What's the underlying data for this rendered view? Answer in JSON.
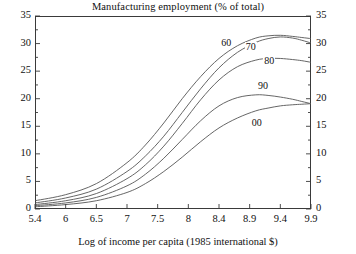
{
  "chart_data": {
    "type": "line",
    "title": "Manufacturing employment (% of total)",
    "xlabel": "Log of income per capita (1985 international $)",
    "ylabel": "",
    "xlim": [
      5.4,
      9.9
    ],
    "ylim": [
      0,
      35
    ],
    "grid": false,
    "legend_position": "inline-labels",
    "x_ticks": [
      "5.4",
      "6",
      "6.5",
      "7",
      "7.5",
      "8",
      "8.4",
      "8.9",
      "9.4",
      "9.9"
    ],
    "y_ticks_left": [
      "0",
      "5",
      "10",
      "15",
      "20",
      "25",
      "30",
      "35"
    ],
    "y_ticks_right": [
      "0",
      "5",
      "10",
      "15",
      "20",
      "25",
      "30",
      "35"
    ],
    "y_minor_tick_step": 2.5,
    "series": [
      {
        "name": "60",
        "label": "60",
        "x": [
          5.4,
          5.9,
          6.4,
          6.9,
          7.2,
          7.5,
          7.8,
          8.1,
          8.4,
          8.7,
          9.0,
          9.2,
          9.4,
          9.6,
          9.75,
          9.9
        ],
        "values": [
          1.5,
          2.6,
          4.6,
          8.4,
          11.6,
          15.6,
          20.0,
          24.0,
          27.3,
          29.6,
          31.0,
          31.4,
          31.5,
          31.3,
          31.1,
          30.9
        ]
      },
      {
        "name": "70",
        "label": "70",
        "x": [
          5.4,
          5.9,
          6.4,
          6.9,
          7.2,
          7.5,
          7.8,
          8.1,
          8.4,
          8.7,
          9.0,
          9.2,
          9.4,
          9.6,
          9.75,
          9.9
        ],
        "values": [
          1.1,
          2.0,
          3.6,
          6.8,
          9.6,
          13.2,
          17.5,
          21.8,
          25.6,
          28.4,
          30.2,
          30.9,
          31.2,
          31.0,
          30.6,
          30.1
        ]
      },
      {
        "name": "80",
        "label": "80",
        "x": [
          5.4,
          5.9,
          6.4,
          6.9,
          7.2,
          7.5,
          7.8,
          8.1,
          8.4,
          8.7,
          9.0,
          9.2,
          9.4,
          9.6,
          9.75,
          9.9
        ],
        "values": [
          0.8,
          1.5,
          2.8,
          5.5,
          8.0,
          11.4,
          15.5,
          19.8,
          23.4,
          25.8,
          27.0,
          27.3,
          27.3,
          27.1,
          26.9,
          26.6
        ]
      },
      {
        "name": "90",
        "label": "90",
        "x": [
          5.4,
          5.9,
          6.4,
          6.9,
          7.2,
          7.5,
          7.8,
          8.1,
          8.4,
          8.7,
          9.0,
          9.2,
          9.4,
          9.6,
          9.75,
          9.9
        ],
        "values": [
          0.6,
          1.1,
          2.1,
          4.2,
          6.3,
          9.2,
          12.6,
          16.0,
          18.7,
          20.2,
          20.7,
          20.6,
          20.3,
          19.9,
          19.5,
          19.1
        ]
      },
      {
        "name": "00",
        "label": "00",
        "x": [
          5.4,
          5.9,
          6.4,
          6.9,
          7.2,
          7.5,
          7.8,
          8.1,
          8.4,
          8.7,
          9.0,
          9.2,
          9.4,
          9.6,
          9.75,
          9.9
        ],
        "values": [
          0.4,
          0.8,
          1.5,
          3.0,
          4.6,
          6.8,
          9.4,
          12.2,
          14.7,
          16.5,
          17.8,
          18.3,
          18.7,
          18.9,
          19.0,
          19.1
        ]
      }
    ],
    "annotations": [
      {
        "text": "60",
        "x": 8.55,
        "y": 30.0
      },
      {
        "text": "70",
        "x": 8.95,
        "y": 29.2
      },
      {
        "text": "80",
        "x": 9.25,
        "y": 26.6
      },
      {
        "text": "90",
        "x": 9.15,
        "y": 22.2
      },
      {
        "text": "00",
        "x": 9.05,
        "y": 15.4
      }
    ],
    "colors": {
      "axis": "#3a3a3a",
      "curve": "#555555",
      "text": "#111111",
      "background": "#ffffff"
    }
  }
}
